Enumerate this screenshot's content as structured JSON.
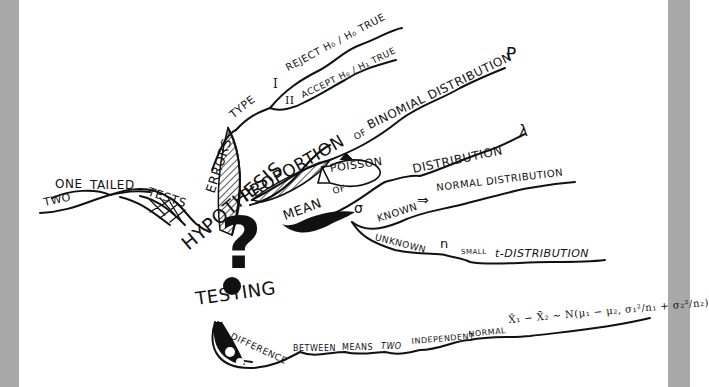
{
  "mindmap": {
    "center": {
      "word1": "HYPOTHESIS",
      "symbol": "?",
      "word2": "TESTING"
    },
    "branches": {
      "tails": {
        "label": "TESTS",
        "options": [
          "ONE",
          "TWO"
        ],
        "modifier": "TAILED"
      },
      "errors": {
        "label": "ERRORS",
        "sub": "TYPE",
        "type1": {
          "numeral": "I",
          "text": "REJECT H₀ / H₀ TRUE"
        },
        "type2": {
          "numeral": "II",
          "text": "ACCEPT H₀ / H₁ TRUE"
        }
      },
      "proportion": {
        "label": "PROPORTION",
        "of": "OF",
        "dist": "BINOMIAL DISTRIBUTION",
        "param": "P"
      },
      "mean": {
        "label": "MEAN",
        "poisson": {
          "of": "OF",
          "fish_text": "POISSON",
          "dist": "DISTRIBUTION",
          "param": "λ"
        },
        "sigma": "σ",
        "known": {
          "label": "KNOWN",
          "arrow": "⇒",
          "dist": "NORMAL DISTRIBUTION"
        },
        "unknown": {
          "label": "UNKNOWN",
          "n": "n",
          "small": "SMALL",
          "dist": "t-DISTRIBUTION"
        }
      },
      "difference": {
        "words": [
          "DIFFERENCE",
          "BETWEEN",
          "MEANS",
          "TWO",
          "INDEPENDENT",
          "NORMAL"
        ],
        "formula": "X̄₁ − X̄₂ ~ N(μ₁ − μ₂, σ₁²/n₁ + σ₂²/n₂)"
      }
    },
    "colors": {
      "ink": "#111111",
      "paper": "#ffffff",
      "frame": "#a9a9a9"
    }
  }
}
